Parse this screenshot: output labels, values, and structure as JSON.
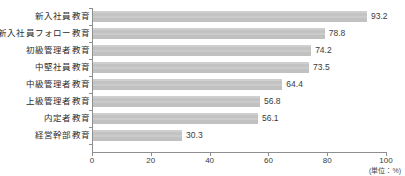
{
  "chart_data": {
    "type": "bar",
    "orientation": "horizontal",
    "title": "",
    "xlabel": "",
    "ylabel": "",
    "unit_note": "(単位：%)",
    "xlim": [
      0,
      100
    ],
    "xticks": [
      0,
      20,
      40,
      60,
      80,
      100
    ],
    "xtick_labels": [
      "0",
      "20",
      "40",
      "60",
      "80",
      "100"
    ],
    "grid": false,
    "legend": false,
    "bar_color": "#c6c6c6",
    "axis_color": "#8f8f8f",
    "text_color": "#2b2b2b",
    "categories": [
      "新入社員教育",
      "新入社員フォロー教育",
      "初級管理者教育",
      "中堅社員教育",
      "中級管理者教育",
      "上級管理者教育",
      "内定者教育",
      "経営幹部教育"
    ],
    "values": [
      93.2,
      78.8,
      74.2,
      73.5,
      64.4,
      56.8,
      56.1,
      30.3
    ],
    "value_labels": [
      "93.2",
      "78.8",
      "74.2",
      "73.5",
      "64.4",
      "56.8",
      "56.1",
      "30.3"
    ]
  }
}
